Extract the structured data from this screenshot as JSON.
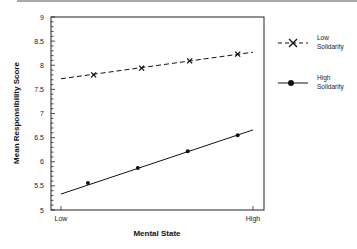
{
  "chart_data": {
    "type": "line",
    "title": "",
    "xlabel": "Mental State",
    "ylabel": "Mean Responsibility Score",
    "ylim": [
      5,
      9
    ],
    "yticks": [
      "5",
      "5.5",
      "6",
      "6.5",
      "7",
      "7.5",
      "8",
      "8.5",
      "9"
    ],
    "xtick_labels": [
      "Low",
      "High"
    ],
    "grid": false,
    "legend_position": "right-outside",
    "series": [
      {
        "name": "Low Solidarity",
        "legend_lines": [
          "Low",
          "Solidarity"
        ],
        "style": "dashed",
        "marker": "x",
        "points": [
          {
            "x": 0.17,
            "y": 7.8
          },
          {
            "x": 0.42,
            "y": 7.94
          },
          {
            "x": 0.67,
            "y": 8.09
          },
          {
            "x": 0.92,
            "y": 8.23
          }
        ],
        "fit_line": {
          "start": {
            "x": 0.0,
            "y": 7.72
          },
          "end": {
            "x": 1.0,
            "y": 8.27
          }
        }
      },
      {
        "name": "High Solidarity",
        "legend_lines": [
          "High",
          "Solidarity"
        ],
        "style": "solid",
        "marker": "circle",
        "points": [
          {
            "x": 0.14,
            "y": 5.56
          },
          {
            "x": 0.4,
            "y": 5.87
          },
          {
            "x": 0.66,
            "y": 6.22
          },
          {
            "x": 0.92,
            "y": 6.55
          }
        ],
        "fit_line": {
          "start": {
            "x": 0.0,
            "y": 5.33
          },
          "end": {
            "x": 1.0,
            "y": 6.66
          }
        }
      }
    ]
  }
}
